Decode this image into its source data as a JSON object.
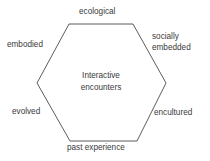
{
  "diagram": {
    "center": {
      "line1": "Interactive",
      "line2": "encounters"
    },
    "sides": {
      "top": "ecological",
      "upper_left": "embodied",
      "upper_right_line1": "socially",
      "upper_right_line2": "embedded",
      "lower_left": "evolved",
      "lower_right": "encultured",
      "bottom": "past experience"
    },
    "colors": {
      "stroke": "#4a4a4a",
      "text": "#3a3a3a"
    }
  }
}
